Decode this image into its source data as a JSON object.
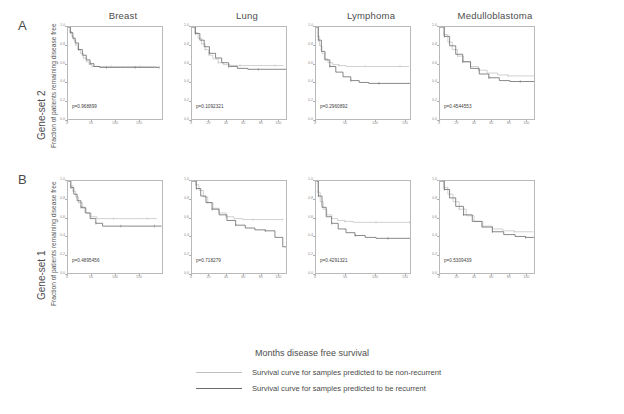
{
  "figure": {
    "panels": [
      {
        "letter": "A",
        "row_label": "Gene-set 2"
      },
      {
        "letter": "B",
        "row_label": "Gene-set 1"
      }
    ],
    "column_titles": [
      "Breast",
      "Lung",
      "Lymphoma",
      "Medulloblastoma"
    ],
    "y_axis_label": "Fraction of patients remaining disease free",
    "x_axis_label": "Months disease free survival",
    "legend": [
      {
        "key": "non-recurrent",
        "label": "Survival curve for samples predicted to be non-recurrent",
        "color": "#bfbfbf"
      },
      {
        "key": "recurrent",
        "label": "Survival curve for samples predicted to be recurrent",
        "color": "#6b6b6b"
      }
    ]
  },
  "chart_data": {
    "type": "line",
    "title": "",
    "xlabel": "Months disease free survival",
    "ylabel": "Fraction of patients remaining disease free",
    "ylim": [
      0.0,
      1.0
    ],
    "grid": false,
    "legend_position": "bottom",
    "panels": [
      {
        "panel": "A",
        "row_label": "Gene-set 2",
        "plots": [
          {
            "title": "Breast",
            "pvalue_text": "p=0.968899",
            "pvalue": 0.968899,
            "xlim": [
              0,
              200
            ],
            "xticks": [
              0,
              50,
              100,
              150
            ],
            "ytick_labels": [
              "0.0",
              "0.2",
              "0.4",
              "0.6",
              "0.8",
              "1.0"
            ],
            "series": [
              {
                "name": "non-recurrent",
                "x": [
                  0,
                  4,
                  8,
                  12,
                  16,
                  20,
                  26,
                  32,
                  38,
                  44,
                  50,
                  58,
                  70,
                  90,
                  110,
                  130,
                  150,
                  170,
                  185
                ],
                "y": [
                  1.0,
                  0.95,
                  0.9,
                  0.86,
                  0.81,
                  0.76,
                  0.72,
                  0.67,
                  0.63,
                  0.6,
                  0.58,
                  0.58,
                  0.58,
                  0.58,
                  0.58,
                  0.58,
                  0.58,
                  0.58,
                  0.58
                ]
              },
              {
                "name": "recurrent",
                "x": [
                  0,
                  5,
                  10,
                  15,
                  22,
                  30,
                  38,
                  46,
                  54,
                  66,
                  80,
                  100,
                  120,
                  140,
                  160,
                  180,
                  190
                ],
                "y": [
                  1.0,
                  0.94,
                  0.88,
                  0.83,
                  0.76,
                  0.7,
                  0.65,
                  0.61,
                  0.58,
                  0.57,
                  0.57,
                  0.57,
                  0.57,
                  0.57,
                  0.57,
                  0.57,
                  0.57
                ]
              }
            ]
          },
          {
            "title": "Lung",
            "pvalue_text": "p=0.1092321",
            "pvalue": 0.1092321,
            "xlim": [
              0,
              110
            ],
            "xticks": [
              0,
              20,
              40,
              60,
              80,
              100
            ],
            "ytick_labels": [
              "0.0",
              "0.2",
              "0.4",
              "0.6",
              "0.8",
              "1.0"
            ],
            "series": [
              {
                "name": "non-recurrent",
                "x": [
                  0,
                  3,
                  7,
                  11,
                  15,
                  19,
                  24,
                  30,
                  36,
                  44,
                  55,
                  68,
                  82,
                  95,
                  105
                ],
                "y": [
                  1.0,
                  0.94,
                  0.88,
                  0.82,
                  0.76,
                  0.7,
                  0.66,
                  0.62,
                  0.6,
                  0.59,
                  0.59,
                  0.59,
                  0.59,
                  0.59,
                  0.59
                ]
              },
              {
                "name": "recurrent",
                "x": [
                  0,
                  4,
                  9,
                  14,
                  20,
                  27,
                  34,
                  42,
                  52,
                  64,
                  76,
                  88,
                  100,
                  108
                ],
                "y": [
                  1.0,
                  0.93,
                  0.86,
                  0.79,
                  0.72,
                  0.67,
                  0.62,
                  0.58,
                  0.56,
                  0.55,
                  0.55,
                  0.55,
                  0.55,
                  0.55
                ]
              }
            ]
          },
          {
            "title": "Lymphoma",
            "pvalue_text": "p=0.2960892",
            "pvalue": 0.2960892,
            "xlim": [
              0,
              160
            ],
            "xticks": [
              0,
              50,
              100,
              150
            ],
            "ytick_labels": [
              "0.0",
              "0.2",
              "0.4",
              "0.6",
              "0.8",
              "1.0"
            ],
            "series": [
              {
                "name": "non-recurrent",
                "x": [
                  0,
                  3,
                  6,
                  10,
                  14,
                  20,
                  28,
                  38,
                  50,
                  65,
                  82,
                  100,
                  120,
                  140,
                  155
                ],
                "y": [
                  1.0,
                  0.9,
                  0.8,
                  0.72,
                  0.66,
                  0.62,
                  0.6,
                  0.59,
                  0.58,
                  0.58,
                  0.58,
                  0.58,
                  0.58,
                  0.58,
                  0.58
                ]
              },
              {
                "name": "recurrent",
                "x": [
                  0,
                  4,
                  9,
                  15,
                  23,
                  33,
                  45,
                  58,
                  72,
                  88,
                  105,
                  125,
                  145,
                  158
                ],
                "y": [
                  1.0,
                  0.86,
                  0.74,
                  0.65,
                  0.58,
                  0.52,
                  0.47,
                  0.43,
                  0.41,
                  0.4,
                  0.4,
                  0.4,
                  0.4,
                  0.4
                ]
              }
            ]
          },
          {
            "title": "Medulloblastoma",
            "pvalue_text": "p=0.4544553",
            "pvalue": 0.4544553,
            "xlim": [
              0,
              110
            ],
            "xticks": [
              0,
              20,
              40,
              60,
              80,
              100
            ],
            "ytick_labels": [
              "0.0",
              "0.2",
              "0.4",
              "0.6",
              "0.8",
              "1.0"
            ],
            "series": [
              {
                "name": "non-recurrent",
                "x": [
                  0,
                  4,
                  9,
                  14,
                  20,
                  27,
                  35,
                  44,
                  54,
                  66,
                  78,
                  90,
                  100,
                  108
                ],
                "y": [
                  1.0,
                  0.92,
                  0.84,
                  0.76,
                  0.69,
                  0.63,
                  0.58,
                  0.54,
                  0.51,
                  0.49,
                  0.48,
                  0.48,
                  0.48,
                  0.48
                ]
              },
              {
                "name": "recurrent",
                "x": [
                  0,
                  5,
                  11,
                  18,
                  26,
                  35,
                  45,
                  56,
                  68,
                  80,
                  92,
                  102,
                  109
                ],
                "y": [
                  1.0,
                  0.9,
                  0.8,
                  0.71,
                  0.63,
                  0.56,
                  0.5,
                  0.46,
                  0.43,
                  0.42,
                  0.42,
                  0.42,
                  0.42
                ]
              }
            ]
          }
        ]
      },
      {
        "panel": "B",
        "row_label": "Gene-set 1",
        "plots": [
          {
            "title": "Breast",
            "pvalue_text": "p=0.4895456",
            "pvalue": 0.4895456,
            "xlim": [
              0,
              200
            ],
            "xticks": [
              0,
              50,
              100,
              150
            ],
            "ytick_labels": [
              "0.0",
              "0.2",
              "0.4",
              "0.6",
              "0.8",
              "1.0"
            ],
            "series": [
              {
                "name": "non-recurrent",
                "x": [
                  0,
                  5,
                  10,
                  16,
                  22,
                  30,
                  38,
                  48,
                  60,
                  75,
                  95,
                  115,
                  140,
                  165,
                  185
                ],
                "y": [
                  1.0,
                  0.95,
                  0.89,
                  0.83,
                  0.77,
                  0.71,
                  0.66,
                  0.62,
                  0.6,
                  0.6,
                  0.6,
                  0.6,
                  0.6,
                  0.6,
                  0.6
                ]
              },
              {
                "name": "recurrent",
                "x": [
                  0,
                  6,
                  12,
                  19,
                  27,
                  36,
                  46,
                  58,
                  72,
                  90,
                  110,
                  135,
                  160,
                  180,
                  195
                ],
                "y": [
                  1.0,
                  0.93,
                  0.86,
                  0.79,
                  0.72,
                  0.66,
                  0.6,
                  0.55,
                  0.52,
                  0.52,
                  0.52,
                  0.52,
                  0.52,
                  0.52,
                  0.52
                ]
              }
            ]
          },
          {
            "title": "Lung",
            "pvalue_text": "p=0.718279",
            "pvalue": 0.718279,
            "xlim": [
              0,
              110
            ],
            "xticks": [
              0,
              20,
              40,
              60,
              80,
              100
            ],
            "ytick_labels": [
              "0.0",
              "0.2",
              "0.4",
              "0.6",
              "0.8",
              "1.0"
            ],
            "series": [
              {
                "name": "non-recurrent",
                "x": [
                  0,
                  4,
                  8,
                  13,
                  18,
                  24,
                  31,
                  39,
                  48,
                  58,
                  70,
                  82,
                  94,
                  104
                ],
                "y": [
                  1.0,
                  0.96,
                  0.9,
                  0.83,
                  0.77,
                  0.71,
                  0.66,
                  0.62,
                  0.6,
                  0.59,
                  0.59,
                  0.59,
                  0.59,
                  0.59
                ]
              },
              {
                "name": "recurrent",
                "x": [
                  0,
                  5,
                  10,
                  16,
                  23,
                  31,
                  40,
                  50,
                  61,
                  72,
                  84,
                  95,
                  104,
                  109
                ],
                "y": [
                  1.0,
                  0.92,
                  0.84,
                  0.77,
                  0.7,
                  0.64,
                  0.58,
                  0.53,
                  0.5,
                  0.48,
                  0.47,
                  0.4,
                  0.3,
                  0.22
                ]
              }
            ]
          },
          {
            "title": "Lymphoma",
            "pvalue_text": "p=0.4291321",
            "pvalue": 0.4291321,
            "xlim": [
              0,
              160
            ],
            "xticks": [
              0,
              50,
              100,
              150
            ],
            "ytick_labels": [
              "0.0",
              "0.2",
              "0.4",
              "0.6",
              "0.8",
              "1.0"
            ],
            "series": [
              {
                "name": "non-recurrent",
                "x": [
                  0,
                  3,
                  7,
                  12,
                  18,
                  26,
                  36,
                  48,
                  62,
                  80,
                  100,
                  122,
                  142,
                  156
                ],
                "y": [
                  1.0,
                  0.88,
                  0.78,
                  0.7,
                  0.64,
                  0.6,
                  0.58,
                  0.57,
                  0.56,
                  0.56,
                  0.56,
                  0.56,
                  0.56,
                  0.56
                ]
              },
              {
                "name": "recurrent",
                "x": [
                  0,
                  4,
                  10,
                  17,
                  26,
                  37,
                  50,
                  65,
                  82,
                  100,
                  120,
                  140,
                  158
                ],
                "y": [
                  1.0,
                  0.84,
                  0.72,
                  0.62,
                  0.55,
                  0.49,
                  0.45,
                  0.42,
                  0.4,
                  0.39,
                  0.39,
                  0.39,
                  0.39
                ]
              }
            ]
          },
          {
            "title": "Medulloblastoma",
            "pvalue_text": "p=0.5309439",
            "pvalue": 0.5309439,
            "xlim": [
              0,
              110
            ],
            "xticks": [
              0,
              20,
              40,
              60,
              80,
              100
            ],
            "ytick_labels": [
              "0.0",
              "0.2",
              "0.4",
              "0.6",
              "0.8",
              "1.0"
            ],
            "series": [
              {
                "name": "non-recurrent",
                "x": [
                  0,
                  4,
                  9,
                  15,
                  22,
                  30,
                  39,
                  49,
                  60,
                  72,
                  85,
                  97,
                  107
                ],
                "y": [
                  1.0,
                  0.93,
                  0.86,
                  0.78,
                  0.7,
                  0.63,
                  0.57,
                  0.52,
                  0.49,
                  0.47,
                  0.46,
                  0.46,
                  0.46
                ]
              },
              {
                "name": "recurrent",
                "x": [
                  0,
                  5,
                  11,
                  18,
                  27,
                  37,
                  48,
                  60,
                  73,
                  86,
                  98,
                  108
                ],
                "y": [
                  1.0,
                  0.91,
                  0.82,
                  0.73,
                  0.64,
                  0.57,
                  0.51,
                  0.46,
                  0.43,
                  0.41,
                  0.4,
                  0.4
                ]
              }
            ]
          }
        ]
      }
    ]
  }
}
